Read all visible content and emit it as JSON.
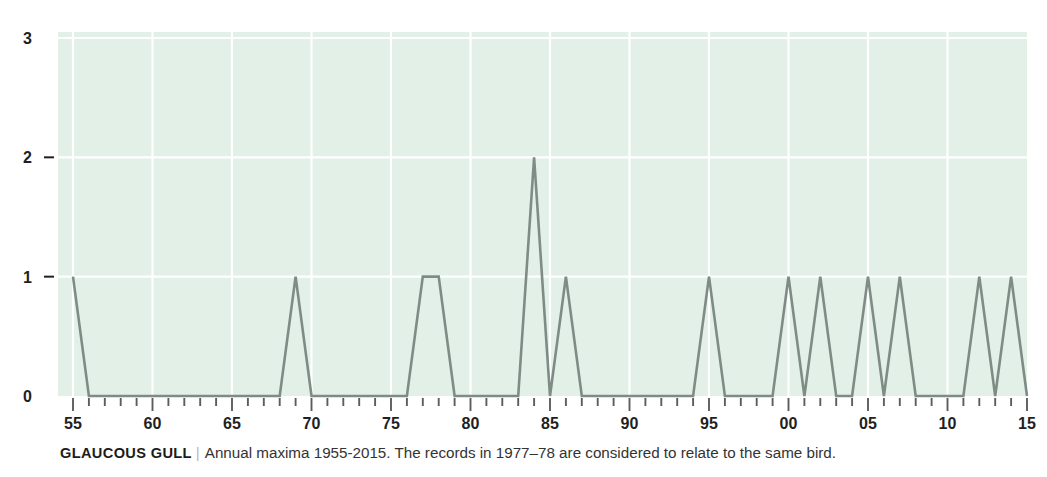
{
  "caption": {
    "species": "GLAUCOUS GULL",
    "divider": "|",
    "note": "Annual maxima 1955-2015. The records in 1977–78 are considered to relate to the same bird."
  },
  "style": {
    "plot_background": "#e2f0e7",
    "gridline_color": "#ffffff",
    "line_color": "#7f8c86",
    "tick_color": "#5d5d5d",
    "text_color": "#231f20"
  },
  "chart_data": {
    "type": "line",
    "title": "",
    "xlabel": "",
    "ylabel": "",
    "grid": true,
    "legend": "none",
    "xlim": [
      1955,
      2015
    ],
    "ylim": [
      0,
      3
    ],
    "ytick_values": [
      0,
      1,
      2,
      3
    ],
    "ytick_labels": [
      "0",
      "1",
      "2",
      "3"
    ],
    "xtick_values": [
      1955,
      1960,
      1965,
      1970,
      1975,
      1980,
      1985,
      1990,
      1995,
      2000,
      2005,
      2010,
      2015
    ],
    "xtick_labels": [
      "55",
      "60",
      "65",
      "70",
      "75",
      "80",
      "85",
      "90",
      "95",
      "00",
      "05",
      "10",
      "15"
    ],
    "x": [
      1955,
      1956,
      1957,
      1958,
      1959,
      1960,
      1961,
      1962,
      1963,
      1964,
      1965,
      1966,
      1967,
      1968,
      1969,
      1970,
      1971,
      1972,
      1973,
      1974,
      1975,
      1976,
      1977,
      1978,
      1979,
      1980,
      1981,
      1982,
      1983,
      1984,
      1985,
      1986,
      1987,
      1988,
      1989,
      1990,
      1991,
      1992,
      1993,
      1994,
      1995,
      1996,
      1997,
      1998,
      1999,
      2000,
      2001,
      2002,
      2003,
      2004,
      2005,
      2006,
      2007,
      2008,
      2009,
      2010,
      2011,
      2012,
      2013,
      2014,
      2015
    ],
    "values": [
      1,
      0,
      0,
      0,
      0,
      0,
      0,
      0,
      0,
      0,
      0,
      0,
      0,
      0,
      1,
      0,
      0,
      0,
      0,
      0,
      0,
      0,
      1,
      1,
      0,
      0,
      0,
      0,
      0,
      2,
      0,
      1,
      0,
      0,
      0,
      0,
      0,
      0,
      0,
      0,
      1,
      0,
      0,
      0,
      0,
      1,
      0,
      1,
      0,
      0,
      1,
      0,
      1,
      0,
      0,
      0,
      0,
      1,
      0,
      1,
      0
    ],
    "series_name": "Annual maxima"
  }
}
